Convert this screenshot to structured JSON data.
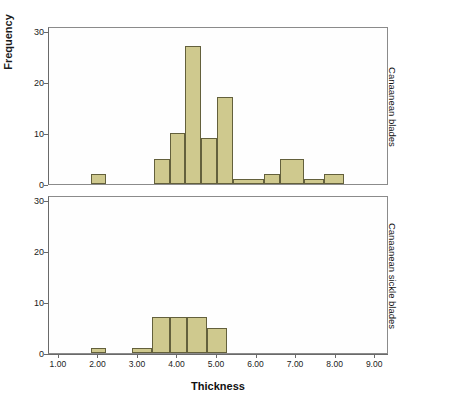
{
  "chart_data": {
    "type": "bar",
    "title": "",
    "subtitle": "",
    "xlabel": "Thickness",
    "ylabel": "Frequency",
    "xlim": [
      0.75,
      9.35
    ],
    "ylim": [
      0,
      31
    ],
    "grid": false,
    "legend_position": "right-strip",
    "xticks": [
      "1.00",
      "2.00",
      "3.00",
      "4.00",
      "5.00",
      "6.00",
      "7.00",
      "8.00",
      "9.00"
    ],
    "xtick_values": [
      1,
      2,
      3,
      4,
      5,
      6,
      7,
      8,
      9
    ],
    "yticks": [
      "0",
      "10",
      "20",
      "30"
    ],
    "ytick_values": [
      0,
      10,
      20,
      30
    ],
    "bin_width": 0.4,
    "panels": [
      {
        "label": "Canaanean blades",
        "bins": [
          {
            "x0": 1.8,
            "x1": 2.2,
            "value": 2
          },
          {
            "x0": 3.4,
            "x1": 3.8,
            "value": 5
          },
          {
            "x0": 3.8,
            "x1": 4.2,
            "value": 10
          },
          {
            "x0": 4.2,
            "x1": 4.6,
            "value": 27
          },
          {
            "x0": 4.6,
            "x1": 5.0,
            "value": 9
          },
          {
            "x0": 5.0,
            "x1": 5.4,
            "value": 17
          },
          {
            "x0": 5.4,
            "x1": 6.2,
            "value": 1
          },
          {
            "x0": 6.2,
            "x1": 6.6,
            "value": 2
          },
          {
            "x0": 6.6,
            "x1": 7.2,
            "value": 5
          },
          {
            "x0": 7.2,
            "x1": 7.7,
            "value": 1
          },
          {
            "x0": 7.7,
            "x1": 8.2,
            "value": 2
          }
        ]
      },
      {
        "label": "Canaanean sickle blades",
        "bins": [
          {
            "x0": 1.8,
            "x1": 2.2,
            "value": 1
          },
          {
            "x0": 2.85,
            "x1": 3.35,
            "value": 1
          },
          {
            "x0": 3.35,
            "x1": 3.8,
            "value": 7
          },
          {
            "x0": 3.8,
            "x1": 4.25,
            "value": 7
          },
          {
            "x0": 4.25,
            "x1": 4.75,
            "value": 7
          },
          {
            "x0": 4.75,
            "x1": 5.25,
            "value": 5
          }
        ]
      }
    ],
    "colors": {
      "bar_fill": "#cfc98e",
      "bar_edge": "#63603c",
      "axis": "#6a6a6a",
      "text": "#111111",
      "plot_background": "#fefefe"
    }
  }
}
